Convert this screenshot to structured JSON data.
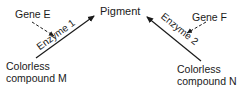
{
  "diagram": {
    "product": "Pigment",
    "left": {
      "gene": "Gene E",
      "enzyme": "Enzyme 1",
      "substrate_line1": "Colorless",
      "substrate_line2": "compound M"
    },
    "right": {
      "gene": "Gene F",
      "enzyme": "Enzyme 2",
      "substrate_line1": "Colorless",
      "substrate_line2": "compound N"
    },
    "colors": {
      "ink": "#1a1a1a",
      "background": "#ffffff"
    }
  }
}
